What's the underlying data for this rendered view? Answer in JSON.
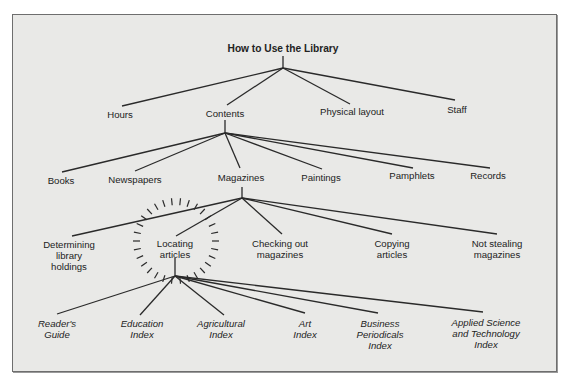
{
  "diagram": {
    "title": "How to Use the Library",
    "colors": {
      "background": "#e9e9e7",
      "frame": "#6e6e6e",
      "line": "#2a2a2a",
      "text": "#222222"
    },
    "nodes": [
      {
        "id": "root",
        "label": "How to Use the Library",
        "x": 283,
        "y": 43,
        "style": "root"
      },
      {
        "id": "hours",
        "label": "Hours",
        "x": 120,
        "y": 109,
        "style": ""
      },
      {
        "id": "contents",
        "label": "Contents",
        "x": 225,
        "y": 108,
        "style": ""
      },
      {
        "id": "physical",
        "label": "Physical layout",
        "x": 352,
        "y": 106,
        "style": ""
      },
      {
        "id": "staff",
        "label": "Staff",
        "x": 457,
        "y": 104,
        "style": ""
      },
      {
        "id": "books",
        "label": "Books",
        "x": 61,
        "y": 175,
        "style": ""
      },
      {
        "id": "newspapers",
        "label": "Newspapers",
        "x": 135,
        "y": 174,
        "style": ""
      },
      {
        "id": "magazines",
        "label": "Magazines",
        "x": 241,
        "y": 172,
        "style": ""
      },
      {
        "id": "paintings",
        "label": "Paintings",
        "x": 321,
        "y": 172,
        "style": ""
      },
      {
        "id": "pamphlets",
        "label": "Pamphlets",
        "x": 412,
        "y": 170,
        "style": ""
      },
      {
        "id": "records",
        "label": "Records",
        "x": 488,
        "y": 170,
        "style": ""
      },
      {
        "id": "determining",
        "label": "Determining\nlibrary\nholdings",
        "x": 69,
        "y": 239,
        "style": ""
      },
      {
        "id": "locating",
        "label": "Locating\narticles",
        "x": 175,
        "y": 238,
        "style": ""
      },
      {
        "id": "checking",
        "label": "Checking out\nmagazines",
        "x": 280,
        "y": 238,
        "style": ""
      },
      {
        "id": "copying",
        "label": "Copying\narticles",
        "x": 392,
        "y": 238,
        "style": ""
      },
      {
        "id": "notstealing",
        "label": "Not stealing\nmagazines",
        "x": 497,
        "y": 238,
        "style": ""
      },
      {
        "id": "readers",
        "label": "Reader's\nGuide",
        "x": 57,
        "y": 318,
        "style": "ital"
      },
      {
        "id": "education",
        "label": "Education\nIndex",
        "x": 142,
        "y": 318,
        "style": "ital"
      },
      {
        "id": "agricultural",
        "label": "Agricultural\nIndex",
        "x": 221,
        "y": 318,
        "style": "ital"
      },
      {
        "id": "art",
        "label": "Art\nIndex",
        "x": 305,
        "y": 318,
        "style": "ital"
      },
      {
        "id": "business",
        "label": "Business\nPeriodicals\nIndex",
        "x": 380,
        "y": 318,
        "style": "ital"
      },
      {
        "id": "applied",
        "label": "Applied Science\nand Technology\nIndex",
        "x": 486,
        "y": 317,
        "style": "ital"
      }
    ],
    "edges": [
      [
        283,
        56,
        283,
        68
      ],
      [
        283,
        68,
        122,
        106
      ],
      [
        283,
        68,
        227,
        105
      ],
      [
        283,
        68,
        350,
        104
      ],
      [
        283,
        68,
        455,
        100
      ],
      [
        225,
        120,
        225,
        133
      ],
      [
        225,
        133,
        62,
        172
      ],
      [
        225,
        133,
        135,
        171
      ],
      [
        225,
        133,
        240,
        168
      ],
      [
        225,
        133,
        322,
        169
      ],
      [
        225,
        133,
        413,
        168
      ],
      [
        225,
        133,
        490,
        168
      ],
      [
        242,
        187,
        242,
        198
      ],
      [
        242,
        198,
        72,
        236
      ],
      [
        242,
        198,
        176,
        236
      ],
      [
        242,
        198,
        282,
        234
      ],
      [
        242,
        198,
        392,
        234
      ],
      [
        242,
        198,
        497,
        234
      ],
      [
        175,
        258,
        175,
        276
      ],
      [
        175,
        276,
        57,
        314
      ],
      [
        175,
        276,
        140,
        315
      ],
      [
        175,
        276,
        224,
        315
      ],
      [
        175,
        276,
        305,
        313
      ],
      [
        175,
        276,
        378,
        313
      ],
      [
        175,
        276,
        483,
        312
      ]
    ],
    "highlight": {
      "target": "locating",
      "cx": 176,
      "cy": 241,
      "r": 40,
      "ticks": 30
    }
  }
}
